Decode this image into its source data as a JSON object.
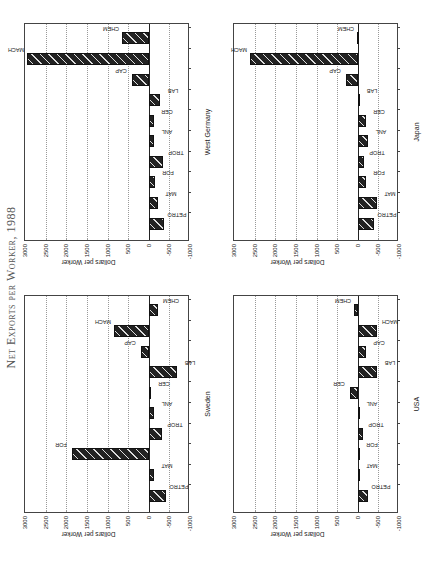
{
  "title": "Net Exports per Worker, 1988",
  "chart_data": [
    {
      "type": "bar",
      "title": "Sweden",
      "ylabel": "Dollars per Worker",
      "ylim": [
        -1000,
        3000
      ],
      "yticks": [
        "3000",
        "2500",
        "2000",
        "1500",
        "1000",
        "500",
        "0",
        "-500",
        "-1000"
      ],
      "grid": true,
      "categories": [
        "PETRO",
        "MAT",
        "FOR",
        "TROP",
        "ANL",
        "CER",
        "LAB",
        "CAP",
        "MACH",
        "CHEM"
      ],
      "values": [
        -420,
        -120,
        1850,
        -325,
        -120,
        -65,
        -695,
        195,
        840,
        -230
      ]
    },
    {
      "type": "bar",
      "title": "USA",
      "ylabel": "Dollars per Worker",
      "ylim": [
        -1000,
        3000
      ],
      "yticks": [
        "3000",
        "2500",
        "2000",
        "1500",
        "1000",
        "500",
        "0",
        "-500",
        "-1000"
      ],
      "grid": true,
      "categories": [
        "PETRO",
        "MAT",
        "FOR",
        "TROP",
        "ANL",
        "CER",
        "LAB",
        "CAP",
        "MACH",
        "CHEM"
      ],
      "values": [
        -240,
        -40,
        -40,
        -120,
        -30,
        190,
        -460,
        -200,
        -460,
        80
      ]
    },
    {
      "type": "bar",
      "title": "West Germany",
      "ylabel": "Dollars per Worker",
      "ylim": [
        -1000,
        3000
      ],
      "yticks": [
        "3000",
        "2500",
        "2000",
        "1500",
        "1000",
        "500",
        "0",
        "-500",
        "-1000"
      ],
      "grid": true,
      "categories": [
        "PETRO",
        "MAT",
        "FOR",
        "TROP",
        "ANL",
        "CER",
        "LAB",
        "CAP",
        "MACH",
        "CHEM"
      ],
      "values": [
        -370,
        -220,
        -150,
        -340,
        -120,
        -120,
        -270,
        395,
        2945,
        640
      ]
    },
    {
      "type": "bar",
      "title": "Japan",
      "ylabel": "Dollars per Worker",
      "ylim": [
        -1000,
        3000
      ],
      "yticks": [
        "3000",
        "2500",
        "2000",
        "1500",
        "1000",
        "500",
        "0",
        "-500",
        "-1000"
      ],
      "grid": true,
      "categories": [
        "PETRO",
        "MAT",
        "FOR",
        "TROP",
        "ANL",
        "CER",
        "LAB",
        "CAP",
        "MACH",
        "CHEM"
      ],
      "values": [
        -400,
        -470,
        -195,
        -150,
        -260,
        -195,
        -20,
        285,
        2615,
        20
      ]
    }
  ]
}
